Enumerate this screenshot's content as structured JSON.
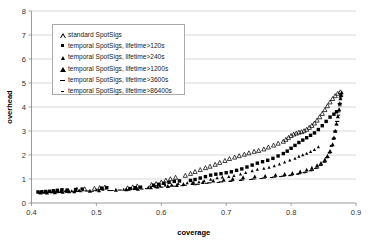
{
  "chart_data": {
    "type": "scatter",
    "title": "",
    "xlabel": "coverage",
    "ylabel": "overhead",
    "xlim": [
      0.4,
      0.9
    ],
    "ylim": [
      0,
      8
    ],
    "xticks": [
      "0.4",
      "0.5",
      "0.6",
      "0.7",
      "0.8",
      "0.9"
    ],
    "yticks": [
      "0",
      "1",
      "2",
      "3",
      "4",
      "5",
      "6",
      "7",
      "8"
    ],
    "grid": "horizontal",
    "legend_position": "upper-left-inside",
    "series": [
      {
        "name": "standard SpotSigs",
        "marker": "triangle-open",
        "points": [
          [
            0.47,
            0.56
          ],
          [
            0.482,
            0.58
          ],
          [
            0.497,
            0.6
          ],
          [
            0.505,
            0.63
          ],
          [
            0.513,
            0.65
          ],
          [
            0.548,
            0.62
          ],
          [
            0.556,
            0.66
          ],
          [
            0.563,
            0.7
          ],
          [
            0.585,
            0.76
          ],
          [
            0.592,
            0.8
          ],
          [
            0.6,
            0.86
          ],
          [
            0.607,
            0.94
          ],
          [
            0.614,
            1.0
          ],
          [
            0.622,
            1.06
          ],
          [
            0.637,
            1.14
          ],
          [
            0.645,
            1.22
          ],
          [
            0.652,
            1.3
          ],
          [
            0.66,
            1.38
          ],
          [
            0.668,
            1.46
          ],
          [
            0.675,
            1.52
          ],
          [
            0.683,
            1.6
          ],
          [
            0.69,
            1.68
          ],
          [
            0.698,
            1.76
          ],
          [
            0.705,
            1.84
          ],
          [
            0.713,
            1.9
          ],
          [
            0.72,
            1.96
          ],
          [
            0.728,
            2.02
          ],
          [
            0.735,
            2.08
          ],
          [
            0.743,
            2.14
          ],
          [
            0.75,
            2.18
          ],
          [
            0.758,
            2.24
          ],
          [
            0.765,
            2.32
          ],
          [
            0.773,
            2.4
          ],
          [
            0.78,
            2.48
          ],
          [
            0.788,
            2.56
          ],
          [
            0.792,
            2.64
          ],
          [
            0.796,
            2.72
          ],
          [
            0.8,
            2.8
          ],
          [
            0.804,
            2.86
          ],
          [
            0.808,
            2.9
          ],
          [
            0.812,
            2.94
          ],
          [
            0.816,
            2.96
          ],
          [
            0.82,
            3.0
          ],
          [
            0.824,
            3.06
          ],
          [
            0.828,
            3.14
          ],
          [
            0.832,
            3.22
          ],
          [
            0.836,
            3.32
          ],
          [
            0.84,
            3.44
          ],
          [
            0.844,
            3.58
          ],
          [
            0.848,
            3.72
          ],
          [
            0.852,
            3.88
          ],
          [
            0.856,
            4.04
          ],
          [
            0.86,
            4.2
          ],
          [
            0.864,
            4.34
          ],
          [
            0.868,
            4.46
          ],
          [
            0.872,
            4.56
          ],
          [
            0.876,
            4.62
          ]
        ]
      },
      {
        "name": "temporal SpotSigs, lifetime>120s",
        "marker": "square-filled",
        "points": [
          [
            0.41,
            0.46
          ],
          [
            0.416,
            0.47
          ],
          [
            0.422,
            0.48
          ],
          [
            0.428,
            0.49
          ],
          [
            0.434,
            0.51
          ],
          [
            0.44,
            0.53
          ],
          [
            0.447,
            0.55
          ],
          [
            0.455,
            0.54
          ],
          [
            0.468,
            0.56
          ],
          [
            0.478,
            0.58
          ],
          [
            0.508,
            0.62
          ],
          [
            0.516,
            0.64
          ],
          [
            0.552,
            0.6
          ],
          [
            0.56,
            0.64
          ],
          [
            0.568,
            0.66
          ],
          [
            0.588,
            0.74
          ],
          [
            0.596,
            0.78
          ],
          [
            0.604,
            0.82
          ],
          [
            0.612,
            0.86
          ],
          [
            0.62,
            0.9
          ],
          [
            0.628,
            0.92
          ],
          [
            0.645,
            0.94
          ],
          [
            0.652,
            0.98
          ],
          [
            0.66,
            1.04
          ],
          [
            0.668,
            1.1
          ],
          [
            0.676,
            1.16
          ],
          [
            0.684,
            1.2
          ],
          [
            0.692,
            1.22
          ],
          [
            0.7,
            1.26
          ],
          [
            0.708,
            1.3
          ],
          [
            0.716,
            1.36
          ],
          [
            0.724,
            1.42
          ],
          [
            0.732,
            1.5
          ],
          [
            0.74,
            1.58
          ],
          [
            0.748,
            1.66
          ],
          [
            0.756,
            1.72
          ],
          [
            0.764,
            1.78
          ],
          [
            0.772,
            1.86
          ],
          [
            0.78,
            1.96
          ],
          [
            0.788,
            2.06
          ],
          [
            0.794,
            2.16
          ],
          [
            0.8,
            2.28
          ],
          [
            0.806,
            2.4
          ],
          [
            0.812,
            2.52
          ],
          [
            0.818,
            2.62
          ],
          [
            0.824,
            2.72
          ],
          [
            0.83,
            2.82
          ],
          [
            0.836,
            2.92
          ],
          [
            0.842,
            3.06
          ],
          [
            0.848,
            3.22
          ],
          [
            0.854,
            3.4
          ],
          [
            0.86,
            3.58
          ],
          [
            0.866,
            3.7
          ],
          [
            0.87,
            3.8
          ]
        ]
      },
      {
        "name": "temporal SpotSigs, lifetime>240s",
        "marker": "triangle-small",
        "points": [
          [
            0.412,
            0.44
          ],
          [
            0.42,
            0.45
          ],
          [
            0.43,
            0.46
          ],
          [
            0.438,
            0.48
          ],
          [
            0.445,
            0.5
          ],
          [
            0.452,
            0.5
          ],
          [
            0.462,
            0.5
          ],
          [
            0.474,
            0.52
          ],
          [
            0.5,
            0.54
          ],
          [
            0.51,
            0.56
          ],
          [
            0.542,
            0.56
          ],
          [
            0.55,
            0.58
          ],
          [
            0.558,
            0.6
          ],
          [
            0.58,
            0.66
          ],
          [
            0.59,
            0.7
          ],
          [
            0.598,
            0.72
          ],
          [
            0.606,
            0.74
          ],
          [
            0.616,
            0.76
          ],
          [
            0.626,
            0.8
          ],
          [
            0.64,
            0.84
          ],
          [
            0.65,
            0.86
          ],
          [
            0.658,
            0.88
          ],
          [
            0.666,
            0.92
          ],
          [
            0.676,
            0.98
          ],
          [
            0.686,
            1.04
          ],
          [
            0.694,
            1.08
          ],
          [
            0.704,
            1.1
          ],
          [
            0.712,
            1.14
          ],
          [
            0.722,
            1.2
          ],
          [
            0.73,
            1.26
          ],
          [
            0.74,
            1.34
          ],
          [
            0.748,
            1.4
          ],
          [
            0.758,
            1.44
          ],
          [
            0.766,
            1.48
          ],
          [
            0.774,
            1.54
          ],
          [
            0.782,
            1.62
          ],
          [
            0.79,
            1.7
          ],
          [
            0.798,
            1.78
          ],
          [
            0.806,
            1.86
          ],
          [
            0.812,
            1.94
          ],
          [
            0.818,
            2.0
          ],
          [
            0.824,
            2.06
          ],
          [
            0.83,
            2.14
          ],
          [
            0.836,
            2.22
          ],
          [
            0.842,
            2.34
          ]
        ]
      },
      {
        "name": "temporal SpotSigs, lifetime>1200s",
        "marker": "triangle-filled",
        "points": [
          [
            0.414,
            0.42
          ],
          [
            0.424,
            0.43
          ],
          [
            0.436,
            0.44
          ],
          [
            0.448,
            0.46
          ],
          [
            0.458,
            0.48
          ],
          [
            0.466,
            0.48
          ],
          [
            0.49,
            0.5
          ],
          [
            0.504,
            0.52
          ],
          [
            0.53,
            0.54
          ],
          [
            0.546,
            0.56
          ],
          [
            0.564,
            0.58
          ],
          [
            0.584,
            0.64
          ],
          [
            0.594,
            0.68
          ],
          [
            0.61,
            0.7
          ],
          [
            0.624,
            0.74
          ],
          [
            0.634,
            0.78
          ],
          [
            0.648,
            0.82
          ],
          [
            0.664,
            0.86
          ],
          [
            0.68,
            0.92
          ],
          [
            0.696,
            0.96
          ],
          [
            0.71,
            1.0
          ],
          [
            0.726,
            1.06
          ],
          [
            0.744,
            1.1
          ],
          [
            0.76,
            1.12
          ],
          [
            0.776,
            1.16
          ],
          [
            0.79,
            1.2
          ],
          [
            0.802,
            1.24
          ],
          [
            0.814,
            1.3
          ],
          [
            0.824,
            1.38
          ],
          [
            0.832,
            1.46
          ],
          [
            0.84,
            1.56
          ],
          [
            0.846,
            1.66
          ],
          [
            0.852,
            1.8
          ],
          [
            0.856,
            1.96
          ],
          [
            0.86,
            2.16
          ],
          [
            0.864,
            2.44
          ],
          [
            0.866,
            2.72
          ],
          [
            0.868,
            3.0
          ],
          [
            0.87,
            3.3
          ],
          [
            0.872,
            3.6
          ],
          [
            0.874,
            3.9
          ],
          [
            0.875,
            4.15
          ],
          [
            0.876,
            4.35
          ],
          [
            0.877,
            4.5
          ],
          [
            0.878,
            4.6
          ]
        ]
      },
      {
        "name": "temporal SpotSigs, lifetime>3600s",
        "marker": "dash",
        "points": [
          [
            0.418,
            0.42
          ],
          [
            0.432,
            0.43
          ],
          [
            0.444,
            0.44
          ],
          [
            0.456,
            0.46
          ],
          [
            0.47,
            0.48
          ],
          [
            0.486,
            0.5
          ],
          [
            0.52,
            0.52
          ],
          [
            0.536,
            0.54
          ],
          [
            0.56,
            0.56
          ],
          [
            0.578,
            0.6
          ],
          [
            0.6,
            0.66
          ],
          [
            0.618,
            0.7
          ],
          [
            0.636,
            0.74
          ],
          [
            0.656,
            0.78
          ],
          [
            0.674,
            0.84
          ],
          [
            0.692,
            0.88
          ],
          [
            0.708,
            0.92
          ],
          [
            0.724,
            0.96
          ],
          [
            0.742,
            1.0
          ],
          [
            0.758,
            1.04
          ],
          [
            0.774,
            1.08
          ],
          [
            0.788,
            1.12
          ],
          [
            0.8,
            1.16
          ],
          [
            0.812,
            1.22
          ],
          [
            0.822,
            1.28
          ],
          [
            0.832,
            1.36
          ],
          [
            0.84,
            1.46
          ],
          [
            0.846,
            1.58
          ],
          [
            0.852,
            1.72
          ],
          [
            0.856,
            1.9
          ],
          [
            0.86,
            2.1
          ],
          [
            0.863,
            2.4
          ],
          [
            0.866,
            2.7
          ],
          [
            0.868,
            3.0
          ],
          [
            0.871,
            3.4
          ],
          [
            0.873,
            3.8
          ],
          [
            0.875,
            4.15
          ],
          [
            0.877,
            4.45
          ]
        ]
      },
      {
        "name": "temporal SpotSigs, lifetime>86400s",
        "marker": "dash-small",
        "points": [
          [
            0.422,
            0.42
          ],
          [
            0.44,
            0.43
          ],
          [
            0.454,
            0.45
          ],
          [
            0.476,
            0.47
          ],
          [
            0.494,
            0.49
          ],
          [
            0.524,
            0.52
          ],
          [
            0.548,
            0.54
          ],
          [
            0.57,
            0.58
          ],
          [
            0.592,
            0.64
          ],
          [
            0.612,
            0.68
          ],
          [
            0.632,
            0.72
          ],
          [
            0.652,
            0.76
          ],
          [
            0.67,
            0.82
          ],
          [
            0.688,
            0.86
          ],
          [
            0.706,
            0.9
          ],
          [
            0.722,
            0.94
          ],
          [
            0.738,
            0.98
          ],
          [
            0.754,
            1.02
          ],
          [
            0.77,
            1.06
          ],
          [
            0.784,
            1.1
          ],
          [
            0.798,
            1.14
          ],
          [
            0.81,
            1.2
          ],
          [
            0.82,
            1.26
          ],
          [
            0.83,
            1.34
          ],
          [
            0.838,
            1.44
          ],
          [
            0.845,
            1.56
          ],
          [
            0.851,
            1.7
          ],
          [
            0.855,
            1.88
          ],
          [
            0.859,
            2.08
          ],
          [
            0.862,
            2.36
          ],
          [
            0.865,
            2.66
          ],
          [
            0.868,
            2.96
          ],
          [
            0.87,
            3.26
          ],
          [
            0.873,
            3.66
          ],
          [
            0.875,
            4.05
          ],
          [
            0.876,
            4.38
          ],
          [
            0.877,
            4.55
          ]
        ]
      }
    ]
  },
  "legend": {
    "entries": [
      {
        "label": "standard SpotSigs",
        "marker": "triangle-open"
      },
      {
        "label": "temporal SpotSigs, lifetime>120s",
        "marker": "square-filled"
      },
      {
        "label": "temporal SpotSigs, lifetime>240s",
        "marker": "triangle-small"
      },
      {
        "label": "temporal SpotSigs, lifetime>1200s",
        "marker": "triangle-filled"
      },
      {
        "label": "temporal SpotSigs, lifetime>3600s",
        "marker": "dash"
      },
      {
        "label": "temporal SpotSigs, lifetime>86400s",
        "marker": "dash-small"
      }
    ]
  },
  "colors": {
    "marker": "#000000",
    "grid": "#c8c8c8",
    "axis": "#808080",
    "background": "#ffffff",
    "legend_border": "#aaaaaa"
  }
}
